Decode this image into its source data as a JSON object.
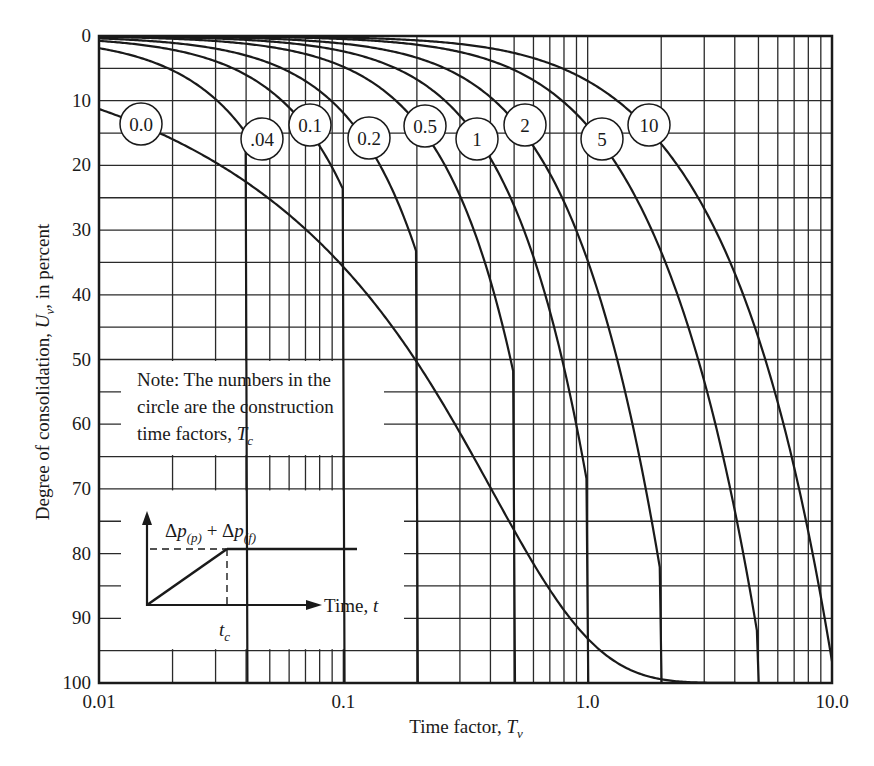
{
  "chart_data": {
    "type": "line",
    "title": "",
    "xlabel": "Time factor, T_v",
    "ylabel": "Degree of consolidation, U_v, in percent",
    "x_scale": "log",
    "xlim": [
      0.01,
      10.0
    ],
    "ylim": [
      0,
      100
    ],
    "y_inverted": true,
    "grid": true,
    "x_tick_labels": [
      "0.01",
      "0.1",
      "1.0",
      "10.0"
    ],
    "x_ticks": [
      0.01,
      0.1,
      1.0,
      10.0
    ],
    "y_tick_labels": [
      "0",
      "10",
      "20",
      "30",
      "40",
      "50",
      "60",
      "70",
      "80",
      "90",
      "100"
    ],
    "y_ticks": [
      0,
      10,
      20,
      30,
      40,
      50,
      60,
      70,
      80,
      90,
      100
    ],
    "legend_position": "inline circles on curves",
    "series_note": "Each series is U_v (%) vs T_v for a construction time factor T_c (ramp loading).",
    "x": [
      0.01,
      0.02,
      0.05,
      0.1,
      0.2,
      0.5,
      1.0,
      2.0,
      5.0,
      10.0
    ],
    "series": [
      {
        "name": "0.0",
        "tc": 0.0,
        "values": [
          11.3,
          16.0,
          25.2,
          35.7,
          50.5,
          76.4,
          93.1,
          99.4,
          100,
          100
        ]
      },
      {
        "name": ".04",
        "tc": 0.04,
        "values": [
          3.8,
          7.5,
          20.5,
          32.1,
          48.6,
          75.5,
          92.8,
          99.4,
          100,
          100
        ]
      },
      {
        "name": "0.1",
        "tc": 0.1,
        "values": [
          1.5,
          3.0,
          7.5,
          15.0,
          42.1,
          73.0,
          92.1,
          99.3,
          100,
          100
        ]
      },
      {
        "name": "0.2",
        "tc": 0.2,
        "values": [
          0.8,
          1.5,
          3.8,
          7.5,
          15.0,
          66.9,
          90.3,
          99.1,
          100,
          100
        ]
      },
      {
        "name": "0.5",
        "tc": 0.5,
        "values": [
          0.3,
          0.6,
          1.5,
          3.0,
          6.0,
          14.8,
          82.7,
          98.4,
          100,
          100
        ]
      },
      {
        "name": "1",
        "tc": 1.0,
        "values": [
          0.2,
          0.3,
          0.8,
          1.5,
          3.0,
          7.4,
          69.5,
          96.8,
          100,
          100
        ]
      },
      {
        "name": "2",
        "tc": 2.0,
        "values": [
          0.1,
          0.2,
          0.4,
          0.8,
          1.5,
          3.7,
          7.4,
          84.7,
          99.9,
          100
        ]
      },
      {
        "name": "5",
        "tc": 5.0,
        "values": [
          0.0,
          0.1,
          0.2,
          0.3,
          0.6,
          1.5,
          3.0,
          6.0,
          93.9,
          100
        ]
      },
      {
        "name": "10",
        "tc": 10.0,
        "values": [
          0.0,
          0.0,
          0.1,
          0.2,
          0.3,
          0.8,
          1.5,
          3.0,
          7.5,
          96.9
        ]
      }
    ],
    "annotations": [
      "Note: The numbers in the circle are the construction time factors, T_c",
      "Inset: load Δp(p) + Δp(f) ramps linearly to t_c then constant; axis Time, t"
    ]
  },
  "axes": {
    "y_title": "Degree of consolidation, ",
    "y_title_sym": "U",
    "y_title_sub": "v",
    "y_title_tail": ", in percent",
    "x_title": "Time factor, ",
    "x_title_sym": "T",
    "x_title_sub": "v"
  },
  "note": {
    "line1": "Note: The numbers in the",
    "line2": "circle are the construction",
    "line3": "time factors, ",
    "line3_sym": "T",
    "line3_sub": "c"
  },
  "inset": {
    "load_label_a": "Δ",
    "load_label_p1": "p",
    "load_label_sub1": "(p)",
    "load_label_plus": " + Δ",
    "load_label_p2": "p",
    "load_label_sub2": "(f)",
    "time_label": "Time, ",
    "time_sym": "t",
    "tc_sym": "t",
    "tc_sub": "c"
  },
  "circles": [
    {
      "label": "0.0",
      "cx": 141,
      "cy": 124
    },
    {
      "label": ".04",
      "cx": 262,
      "cy": 139
    },
    {
      "label": "0.1",
      "cx": 310,
      "cy": 125
    },
    {
      "label": "0.2",
      "cx": 369,
      "cy": 138
    },
    {
      "label": "0.5",
      "cx": 425,
      "cy": 126
    },
    {
      "label": "1",
      "cx": 477,
      "cy": 139
    },
    {
      "label": "2",
      "cx": 525,
      "cy": 125
    },
    {
      "label": "5",
      "cx": 602,
      "cy": 139
    },
    {
      "label": "10",
      "cx": 649,
      "cy": 125
    }
  ],
  "colors": {
    "ink": "#1a1a1a",
    "grid": "#2a2a2a",
    "background": "#ffffff"
  }
}
